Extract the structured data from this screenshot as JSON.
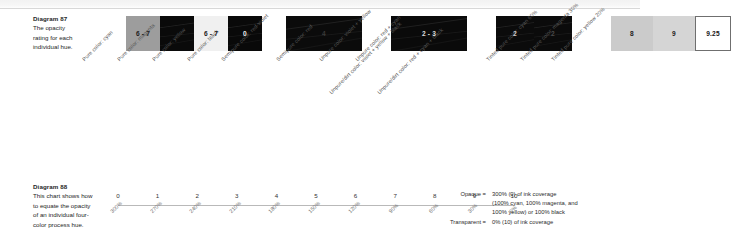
{
  "diagram87": {
    "title": "Diagram 87",
    "caption_lines": [
      "The opacity",
      "rating for each",
      "individual hue."
    ],
    "swatches": [
      {
        "id": "pure-cyan",
        "value": "6 - 7",
        "label": "Pure color: cyan",
        "fill": "#9d9d9d",
        "text": "#1c1c1c",
        "width": 34,
        "group": 0,
        "streaks": false
      },
      {
        "id": "pure-magenta",
        "value": "",
        "label": "Pure color: magenta",
        "fill": "#0a0a0a",
        "text": "#e8e8e8",
        "width": 34,
        "group": 0,
        "streaks": true
      },
      {
        "id": "pure-yellow",
        "value": "6 - 7",
        "label": "Pure color: yellow",
        "fill": "#f0f0f0",
        "text": "#1c1c1c",
        "width": 34,
        "group": 0,
        "streaks": false
      },
      {
        "id": "pure-black",
        "value": "0",
        "label": "Pure color: black",
        "fill": "#090909",
        "text": "#f2f2f2",
        "width": 34,
        "group": 0,
        "streaks": true
      },
      {
        "id": "semipure-red-violet",
        "value": "4",
        "label": "Semipure color: red-violet",
        "fill": "#0b0b0b",
        "text": "#3a3a3a",
        "width": 76,
        "group": 1,
        "streaks": true
      },
      {
        "id": "semipure-red",
        "value": "2 - 3",
        "label": "Semipure color: red",
        "fill": "#0a0a0a",
        "text": "#dcdcdc",
        "width": 76,
        "group": 2,
        "streaks": true
      },
      {
        "id": "unpure-violet-yellow",
        "value": "2",
        "label": "Unpure color: violet + yellow",
        "fill": "#0b0b0b",
        "text": "#cfcfcf",
        "width": 38,
        "group": 3,
        "streaks": true
      },
      {
        "id": "unpure-red-cyan",
        "value": "2",
        "label": "Unpure color: red + cyan",
        "fill": "#0b0b0b",
        "text": "#4a4a4a",
        "width": 38,
        "group": 3,
        "streaks": true
      },
      {
        "id": "unpuredirt-violet-yellow-black",
        "value": "",
        "label": "Unpure/dirt color: violet + yellow + black",
        "fill": "#0a0a0a",
        "text": "#cfcfcf",
        "width": 0,
        "group": 3,
        "streaks": true
      },
      {
        "id": "unpuredirt-red-cyan-black",
        "value": "",
        "label": "Unpure/dirt color: red + cyan + black",
        "fill": "#0a0a0a",
        "text": "#cfcfcf",
        "width": 0,
        "group": 3,
        "streaks": true
      },
      {
        "id": "tinted-cyan-60",
        "value": "8",
        "label": "Tinted pure color: cyan 60%",
        "fill": "#cbcbcb",
        "text": "#202020",
        "width": 42,
        "group": 4,
        "streaks": false
      },
      {
        "id": "tinted-magenta-30",
        "value": "9",
        "label": "Tinted pure color: magenta 30%",
        "fill": "#d5d5d5",
        "text": "#202020",
        "width": 42,
        "group": 4,
        "streaks": false
      },
      {
        "id": "tinted-yellow-20",
        "value": "9.25",
        "label": "Tinted pure color: yellow 20%",
        "fill": "#ffffff",
        "text": "#141414",
        "width": 36,
        "group": 4,
        "streaks": false
      }
    ]
  },
  "diagram88": {
    "title": "Diagram 88",
    "caption_lines": [
      "This chart shows how",
      "to equate the opacity",
      "of an individual four-",
      "color process hue."
    ],
    "scale_numbers": [
      "0",
      "1",
      "2",
      "3",
      "4",
      "5",
      "6",
      "7",
      "8",
      "9",
      "10"
    ],
    "scale_percents": [
      "300%",
      "270%",
      "240%",
      "210%",
      "180%",
      "150%",
      "120%",
      "90%",
      "60%",
      "30%",
      "0%"
    ]
  },
  "legend": {
    "opaque_term": "Opaque =",
    "opaque_lines": [
      "300% (0) of ink coverage",
      "(100% cyan, 100% magenta, and",
      "100% yellow) or 100% black"
    ],
    "transparent_term": "Transparent =",
    "transparent_lines": [
      "0% (10) of ink coverage"
    ]
  }
}
